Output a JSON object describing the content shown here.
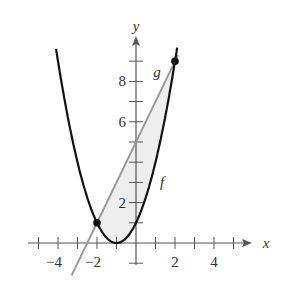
{
  "chart_data": {
    "type": "line",
    "title": "",
    "xlabel": "x",
    "ylabel": "y",
    "xlim": [
      -5,
      5.5
    ],
    "ylim": [
      -1,
      10
    ],
    "x_ticks": [
      -4,
      -2,
      2,
      4
    ],
    "y_ticks": [
      2,
      6,
      8
    ],
    "grid": false,
    "series": [
      {
        "name": "f",
        "equation": "f(x) = (x+1)^2",
        "color": "#111111"
      },
      {
        "name": "g",
        "equation": "g(x) = 2x + 5",
        "color": "#999999"
      }
    ],
    "intersection_points": [
      [
        -2,
        1
      ],
      [
        2,
        9
      ]
    ],
    "shaded_region": {
      "between": [
        "f",
        "g"
      ],
      "x_from": -2,
      "x_to": 2,
      "color": "#eeeeee"
    }
  },
  "labels": {
    "x_axis": "x",
    "y_axis": "y",
    "f_label": "f",
    "g_label": "g",
    "x_tick_labels": [
      "−4",
      "−2",
      "2",
      "4"
    ],
    "y_tick_labels": [
      "2",
      "6",
      "8"
    ]
  }
}
